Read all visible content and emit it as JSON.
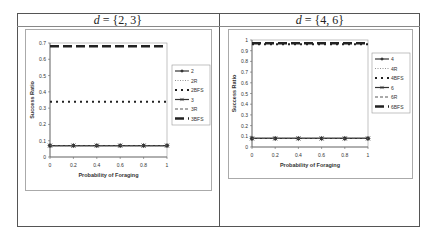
{
  "panels": [
    {
      "title_var": "d",
      "title_rest": " = {2, 3}"
    },
    {
      "title_var": "d",
      "title_rest": " = {4, 6}"
    }
  ],
  "chart_data": [
    {
      "type": "line",
      "title": "d = {2, 3}",
      "xlabel": "Probability of Foraging",
      "ylabel": "Success Ratio",
      "x": [
        0,
        0.2,
        0.4,
        0.6,
        0.8,
        1
      ],
      "xticks": [
        "0",
        "0.2",
        "0.4",
        "0.6",
        "0.8",
        "1"
      ],
      "yticks": [
        "0",
        "0.1",
        "0.2",
        "0.3",
        "0.4",
        "0.5",
        "0.6",
        "0.7"
      ],
      "ylim": [
        0,
        0.7
      ],
      "xlim": [
        0,
        1
      ],
      "grid": false,
      "legend": "right",
      "series": [
        {
          "name": "2",
          "style": "solid-diamond",
          "values": [
            0.07,
            0.07,
            0.07,
            0.07,
            0.07,
            0.07
          ]
        },
        {
          "name": "2R",
          "style": "dotted",
          "values": [
            0.07,
            0.07,
            0.07,
            0.07,
            0.07,
            0.07
          ]
        },
        {
          "name": "2BFS",
          "style": "dot-dash-heavy",
          "values": [
            0.34,
            0.34,
            0.34,
            0.34,
            0.34,
            0.34
          ]
        },
        {
          "name": "3",
          "style": "solid-x",
          "values": [
            0.07,
            0.07,
            0.07,
            0.07,
            0.07,
            0.07
          ]
        },
        {
          "name": "3R",
          "style": "dashed",
          "values": [
            0.07,
            0.07,
            0.07,
            0.07,
            0.07,
            0.07
          ]
        },
        {
          "name": "3BFS",
          "style": "long-dash-heavy",
          "values": [
            0.68,
            0.68,
            0.68,
            0.68,
            0.68,
            0.68
          ]
        }
      ]
    },
    {
      "type": "line",
      "title": "d = {4, 6}",
      "xlabel": "Probability of Foraging",
      "ylabel": "Success Ratio",
      "x": [
        0,
        0.2,
        0.4,
        0.6,
        0.8,
        1
      ],
      "xticks": [
        "0",
        "0.2",
        "0.4",
        "0.6",
        "0.8",
        "1"
      ],
      "yticks": [
        "0",
        "0.1",
        "0.2",
        "0.3",
        "0.4",
        "0.5",
        "0.6",
        "0.7",
        "0.8",
        "0.9",
        "1"
      ],
      "ylim": [
        0,
        1
      ],
      "xlim": [
        0,
        1
      ],
      "grid": false,
      "legend": "right",
      "series": [
        {
          "name": "4",
          "style": "solid-diamond",
          "values": [
            0.08,
            0.08,
            0.08,
            0.08,
            0.08,
            0.08
          ]
        },
        {
          "name": "4R",
          "style": "dotted",
          "values": [
            0.08,
            0.08,
            0.08,
            0.08,
            0.08,
            0.08
          ]
        },
        {
          "name": "4BFS",
          "style": "dot-dash-heavy",
          "values": [
            0.96,
            0.96,
            0.96,
            0.96,
            0.96,
            0.96
          ]
        },
        {
          "name": "6",
          "style": "solid-x",
          "values": [
            0.08,
            0.08,
            0.08,
            0.08,
            0.08,
            0.08
          ]
        },
        {
          "name": "6R",
          "style": "dashed",
          "values": [
            0.08,
            0.08,
            0.08,
            0.08,
            0.08,
            0.08
          ]
        },
        {
          "name": "6BFS",
          "style": "long-dash-heavy",
          "values": [
            0.97,
            0.97,
            0.97,
            0.97,
            0.97,
            0.97
          ]
        }
      ]
    }
  ]
}
